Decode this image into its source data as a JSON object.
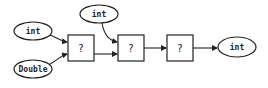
{
  "diagram": {
    "inputs": [
      {
        "id": "in1",
        "label": "int"
      },
      {
        "id": "in2",
        "label": "Double"
      },
      {
        "id": "in3",
        "label": "int"
      }
    ],
    "nodes": [
      {
        "id": "n1",
        "label": "?"
      },
      {
        "id": "n2",
        "label": "?"
      },
      {
        "id": "n3",
        "label": "?"
      }
    ],
    "output": {
      "id": "out",
      "label": "int"
    },
    "edges": [
      {
        "from": "in1",
        "to": "n1"
      },
      {
        "from": "in2",
        "to": "n1"
      },
      {
        "from": "n1",
        "to": "n2"
      },
      {
        "from": "in3",
        "to": "n2"
      },
      {
        "from": "n2",
        "to": "n3"
      },
      {
        "from": "n3",
        "to": "out"
      }
    ]
  }
}
